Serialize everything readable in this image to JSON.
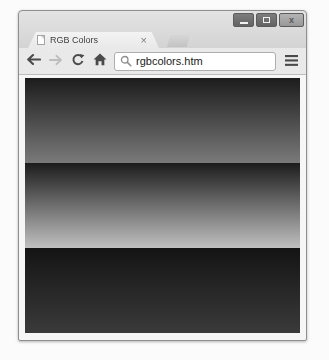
{
  "window": {
    "title": "RGB Colors",
    "controls": {
      "minimize": "minimize",
      "maximize": "maximize",
      "close_glyph": "x"
    }
  },
  "tab": {
    "title": "RGB Colors",
    "close_glyph": "×"
  },
  "toolbar": {
    "url": "rgbcolors.htm"
  },
  "icons": {
    "back": "left-arrow",
    "forward": "right-arrow",
    "reload": "circular-arrow",
    "home": "house",
    "search": "magnifier",
    "menu": "hamburger",
    "favicon": "blank-page"
  },
  "colors": {
    "chrome_bg": "#d9d9d9",
    "toolbar_bg": "#e9e9e9",
    "canvas_bg": "#0c0c0c",
    "disabled_icon": "#bdbdbd",
    "active_icon": "#4a4a4a"
  },
  "content": {
    "description": "three horizontal gradient bands (grayscale print of red, green, blue gradients)",
    "bands": [
      {
        "name": "gradient-band-1",
        "from": "#1c1c1c",
        "to": "#7a7a7a"
      },
      {
        "name": "gradient-band-2",
        "from": "#1c1c1c",
        "to": "#c0c0c0"
      },
      {
        "name": "gradient-band-3",
        "from": "#141414",
        "to": "#3a3a3a"
      }
    ]
  }
}
